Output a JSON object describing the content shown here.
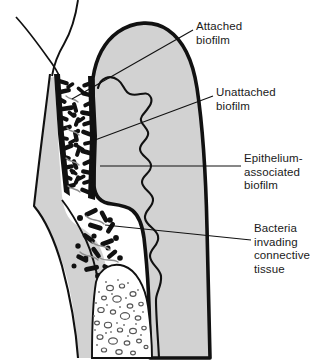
{
  "figure": {
    "kind": "anatomical-diagram",
    "background_color": "#ffffff",
    "ink_color": "#1a1a1a",
    "tissue_fill": "#d2d2d2",
    "pocket_fill": "#ffffff",
    "bone_fill": "#ffffff",
    "bacteria_color": "#111111"
  },
  "labels": [
    {
      "id": "attached",
      "name": "attached-biofilm-label",
      "lines": [
        "Attached",
        "biofilm"
      ],
      "line1": "Attached",
      "line2": "biofilm",
      "leader_from": [
        193,
        30
      ],
      "leader_to": [
        72,
        99
      ]
    },
    {
      "id": "unattached",
      "name": "unattached-biofilm-label",
      "lines": [
        "Unattached",
        "biofilm"
      ],
      "line1": "Unattached",
      "line2": "biofilm",
      "leader_from": [
        213,
        96
      ],
      "leader_to": [
        95,
        140
      ]
    },
    {
      "id": "epithelium",
      "name": "epithelium-associated-biofilm-label",
      "lines": [
        "Epithelium-",
        "associated",
        "biofilm"
      ],
      "line1": "Epithelium-",
      "line2": "associated",
      "line3": "biofilm",
      "leader_from": [
        241,
        166
      ],
      "leader_to": [
        100,
        166
      ]
    },
    {
      "id": "bacteria",
      "name": "bacteria-invading-connective-tissue-label",
      "lines": [
        "Bacteria",
        "invading",
        "connective",
        "tissue"
      ],
      "line1": "Bacteria",
      "line2": "invading",
      "line3": "connective",
      "line4": "tissue",
      "leader_from": [
        251,
        240
      ],
      "leader_to": [
        105,
        225
      ]
    }
  ],
  "structures": [
    {
      "id": "tooth-surface",
      "name": "tooth-surface-outline"
    },
    {
      "id": "gingiva",
      "name": "gingiva-body"
    },
    {
      "id": "gingival-margin",
      "name": "gingival-margin-outline"
    },
    {
      "id": "pocket",
      "name": "periodontal-pocket-lumen"
    },
    {
      "id": "epithelium",
      "name": "pocket-epithelium-rete-pegs"
    },
    {
      "id": "connective-tissue",
      "name": "connective-tissue-region"
    },
    {
      "id": "alveolar-bone",
      "name": "alveolar-bone-trabeculae"
    },
    {
      "id": "pdl",
      "name": "periodontal-ligament-line"
    }
  ]
}
